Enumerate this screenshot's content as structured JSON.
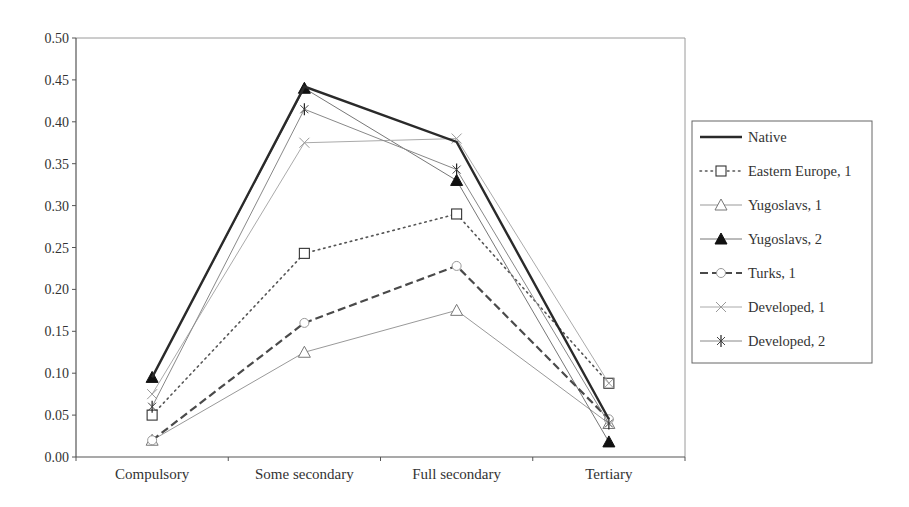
{
  "chart_data": {
    "type": "line",
    "title": "",
    "xlabel": "",
    "ylabel": "",
    "ylim": [
      0,
      0.5
    ],
    "yticks": [
      "0.00",
      "0.05",
      "0.10",
      "0.15",
      "0.20",
      "0.25",
      "0.30",
      "0.35",
      "0.40",
      "0.45",
      "0.50"
    ],
    "categories": [
      "Compulsory",
      "Some secondary",
      "Full secondary",
      "Tertiary"
    ],
    "grid": false,
    "legend_position": "right",
    "series": [
      {
        "name": "Native",
        "values": [
          0.095,
          0.442,
          0.376,
          0.045
        ],
        "style": "solid-thick",
        "marker": "none",
        "color": "#333333"
      },
      {
        "name": "Eastern Europe, 1",
        "values": [
          0.05,
          0.243,
          0.29,
          0.088
        ],
        "style": "dotted",
        "marker": "square-open",
        "color": "#555555"
      },
      {
        "name": "Yugoslavs, 1",
        "values": [
          0.02,
          0.125,
          0.175,
          0.04
        ],
        "style": "solid-thin",
        "marker": "triangle-open",
        "color": "#999999"
      },
      {
        "name": "Yugoslavs, 2",
        "values": [
          0.095,
          0.44,
          0.33,
          0.018
        ],
        "style": "solid-thin",
        "marker": "triangle-filled",
        "color": "#777777"
      },
      {
        "name": "Turks, 1",
        "values": [
          0.02,
          0.16,
          0.228,
          0.045
        ],
        "style": "dashed",
        "marker": "circle-open",
        "color": "#555555"
      },
      {
        "name": "Developed, 1",
        "values": [
          0.075,
          0.375,
          0.38,
          0.088
        ],
        "style": "solid-thin",
        "marker": "x",
        "color": "#aaaaaa"
      },
      {
        "name": "Developed, 2",
        "values": [
          0.06,
          0.415,
          0.343,
          0.04
        ],
        "style": "solid-thin",
        "marker": "star",
        "color": "#888888"
      }
    ]
  }
}
